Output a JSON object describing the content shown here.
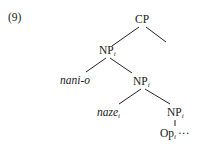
{
  "example_number": "(9)",
  "tree": {
    "root": {
      "label": "CP"
    },
    "nodes": [
      {
        "id": "np1",
        "label": "NP",
        "index": "i"
      },
      {
        "id": "nani",
        "label": "nani-o",
        "italic": true
      },
      {
        "id": "np2",
        "label": "NP",
        "index": "i"
      },
      {
        "id": "naze",
        "label": "naze",
        "index": "i",
        "italic": true
      },
      {
        "id": "np3",
        "label": "NP",
        "index": "i"
      },
      {
        "id": "op",
        "label": "Op",
        "index": "i",
        "trailing": "···"
      }
    ],
    "edges": [
      [
        "CP",
        "np1"
      ],
      [
        "CP",
        "empty-right"
      ],
      [
        "np1",
        "nani"
      ],
      [
        "np1",
        "np2"
      ],
      [
        "np2",
        "naze"
      ],
      [
        "np2",
        "np3"
      ],
      [
        "np3",
        "op"
      ]
    ]
  }
}
